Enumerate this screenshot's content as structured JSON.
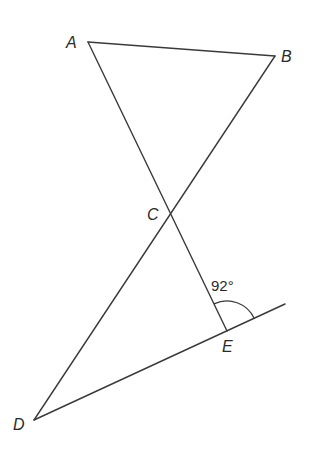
{
  "diagram": {
    "points": {
      "A": {
        "label": "A",
        "x": 88,
        "y": 42,
        "lx": 66,
        "ly": 48
      },
      "B": {
        "label": "B",
        "x": 275,
        "y": 56,
        "lx": 281,
        "ly": 62
      },
      "C": {
        "label": "C",
        "x": 170,
        "y": 212,
        "lx": 147,
        "ly": 220
      },
      "D": {
        "label": "D",
        "x": 34,
        "y": 420,
        "lx": 13,
        "ly": 430
      },
      "E": {
        "label": "E",
        "x": 227,
        "y": 331,
        "lx": 222,
        "ly": 352
      }
    },
    "segments": [
      {
        "name": "segment-ab",
        "from": "A",
        "to": "B"
      },
      {
        "name": "segment-ae",
        "from": "A",
        "to": "E"
      },
      {
        "name": "segment-bd",
        "from": "B",
        "to": "D"
      },
      {
        "name": "segment-d-ext",
        "from": "D",
        "to": "EXT"
      }
    ],
    "extension_end": {
      "x": 285,
      "y": 304
    },
    "angle": {
      "label": "92°",
      "vertex": "E",
      "lx": 211,
      "ly": 291
    }
  }
}
